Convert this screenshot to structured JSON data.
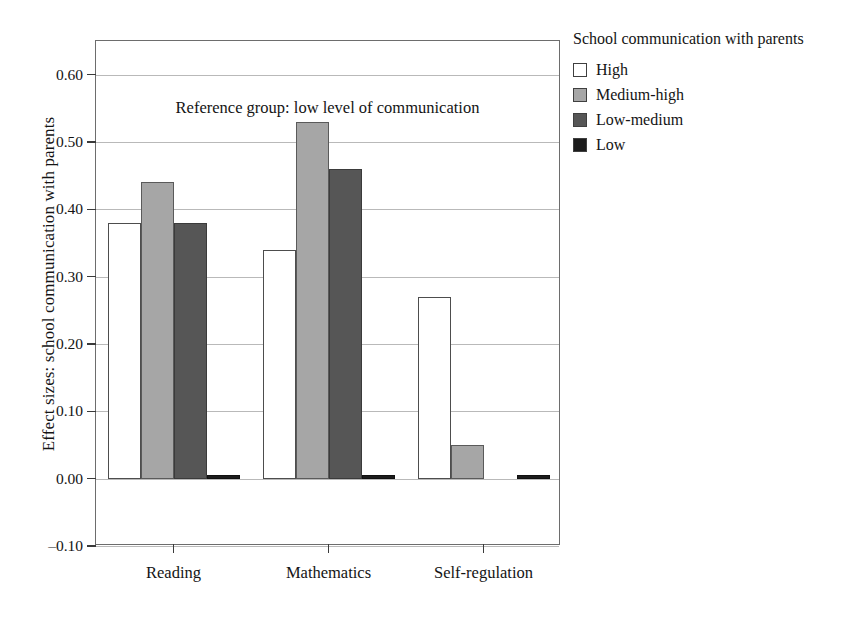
{
  "figure": {
    "annotation": "Reference group: low level of communication",
    "y_axis_title": "Effect sizes: school communication with parents"
  },
  "legend": {
    "title": "School communication with parents",
    "items": [
      {
        "label": "High",
        "color": "#ffffff",
        "swatch": "sw-white"
      },
      {
        "label": "Medium-high",
        "color": "#a6a6a6",
        "swatch": "sw-medhigh"
      },
      {
        "label": "Low-medium",
        "color": "#565656",
        "swatch": "sw-lowmed"
      },
      {
        "label": "Low",
        "color": "#1c1c1c",
        "swatch": "sw-low"
      }
    ]
  },
  "chart_data": {
    "type": "bar",
    "title": "",
    "xlabel": "",
    "ylabel": "Effect sizes: school communication with parents",
    "categories": [
      "Reading",
      "Mathematics",
      "Self-regulation"
    ],
    "series": [
      {
        "name": "High",
        "color": "#ffffff",
        "values": [
          0.38,
          0.34,
          0.27
        ]
      },
      {
        "name": "Medium-high",
        "color": "#a6a6a6",
        "values": [
          0.44,
          0.53,
          0.05
        ]
      },
      {
        "name": "Low-medium",
        "color": "#565656",
        "values": [
          0.38,
          0.46,
          0.0
        ]
      },
      {
        "name": "Low",
        "color": "#1c1c1c",
        "values": [
          0.005,
          0.005,
          0.005
        ]
      }
    ],
    "ylim": [
      -0.1,
      0.65
    ],
    "yticks": [
      -0.1,
      0.0,
      0.1,
      0.2,
      0.3,
      0.4,
      0.5,
      0.6
    ],
    "ytick_labels": [
      "-0.10",
      "0.00",
      "0.10",
      "0.20",
      "0.30",
      "0.40",
      "0.50",
      "0.60"
    ],
    "grid": true,
    "legend_position": "right",
    "annotations": [
      "Reference group: low level of communication"
    ]
  }
}
